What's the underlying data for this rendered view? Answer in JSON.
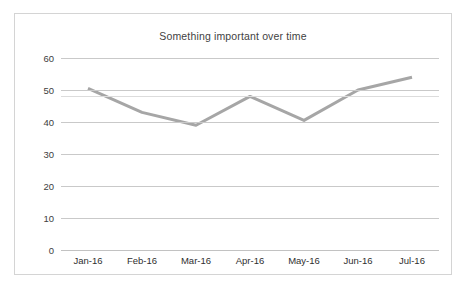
{
  "chart_data": {
    "type": "line",
    "title": "Something important over time",
    "xlabel": "",
    "ylabel": "",
    "categories": [
      "Jan-16",
      "Feb-16",
      "Mar-16",
      "Apr-16",
      "May-16",
      "Jun-16",
      "Jul-16"
    ],
    "values": [
      50.5,
      43,
      39,
      48,
      40.5,
      50,
      54
    ],
    "series": [
      {
        "name": "Something important",
        "values": [
          50.5,
          43,
          39,
          48,
          40.5,
          50,
          54
        ]
      }
    ],
    "ylim": [
      0,
      60
    ],
    "yticks": [
      0,
      10,
      20,
      30,
      40,
      50,
      60
    ],
    "ytick_labels": [
      "0",
      "10",
      "20",
      "30",
      "40",
      "50",
      "60"
    ],
    "grid": true,
    "legend": false,
    "legend_position": "none",
    "reference_line": {
      "value": 48,
      "label": "",
      "color": "#dcdcdc"
    },
    "colors": {
      "line": "#a6a6a6",
      "gridline": "#c9c9c9",
      "axis_text": "#404040",
      "title_text": "#3f3f3f",
      "border": "#d4d4d4",
      "background": "#ffffff"
    },
    "line_width": 3
  }
}
